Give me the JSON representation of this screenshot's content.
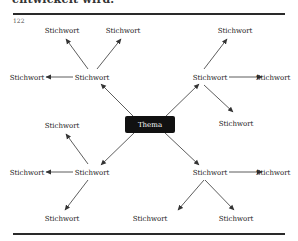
{
  "page": {
    "top_text_fragment": "entwickelt wird.",
    "page_number": "122"
  },
  "diagram": {
    "center": {
      "label": "Thema",
      "fill": "#111111",
      "text_color": "#ffffff"
    },
    "hubs": [
      {
        "label": "Stichwort"
      },
      {
        "label": "Stichwort"
      },
      {
        "label": "Stichwort"
      },
      {
        "label": "Stichwort"
      }
    ],
    "leaves": [
      {
        "label": "Stichwort"
      },
      {
        "label": "Stichwort"
      },
      {
        "label": "Stichwort"
      },
      {
        "label": "Stichwort"
      },
      {
        "label": "Stichwort"
      },
      {
        "label": "Stichwort"
      },
      {
        "label": "Stichwort"
      },
      {
        "label": "Stichwort"
      },
      {
        "label": "Stichwort"
      },
      {
        "label": "Stichwort"
      },
      {
        "label": "Stichwort"
      },
      {
        "label": "Stichwort"
      }
    ],
    "arrow_color": "#333333"
  }
}
